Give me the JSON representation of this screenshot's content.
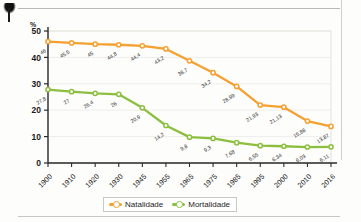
{
  "page": {
    "title_partial": "1900-2016",
    "credit": "ERICSON GUILHERME LUCIANO",
    "unit_label": "%"
  },
  "legend": {
    "items": [
      {
        "label": "Natalidade",
        "color": "#F5A030"
      },
      {
        "label": "Mortalidade",
        "color": "#8CBF3F"
      }
    ]
  },
  "chart_data": {
    "type": "line",
    "title": "1900-2016",
    "xlabel": "",
    "ylabel": "%",
    "ylim": [
      0,
      50
    ],
    "yticks": [
      "0",
      "10",
      "20",
      "30",
      "40",
      "50"
    ],
    "grid": true,
    "legend_position": "bottom",
    "categories": [
      "1900",
      "1910",
      "1920",
      "1930",
      "1945",
      "1955",
      "1965",
      "1975",
      "1985",
      "1995",
      "2000",
      "2010",
      "2016"
    ],
    "series": [
      {
        "name": "Natalidade",
        "color": "#F5A030",
        "values": [
          46,
          45.5,
          45,
          44.8,
          44.4,
          43.2,
          38.7,
          34.2,
          28.99,
          21.93,
          21.13,
          15.88,
          13.87
        ],
        "labels": [
          "46",
          "45,5",
          "45",
          "44,8",
          "44,4",
          "43,2",
          "38,7",
          "34,2",
          "28,99",
          "21,93",
          "21,13",
          "15,88",
          "13,87"
        ]
      },
      {
        "name": "Mortalidade",
        "color": "#8CBF3F",
        "values": [
          27.8,
          27,
          26.4,
          26,
          20.9,
          14.2,
          9.8,
          9.3,
          7.68,
          6.55,
          6.34,
          6.03,
          6.11
        ],
        "labels": [
          "27,8",
          "27",
          "26,4",
          "26",
          "20,9",
          "14,2",
          "9,8",
          "9,3",
          "7,68",
          "6,55",
          "6,34",
          "6,03",
          "6,11"
        ]
      }
    ]
  }
}
